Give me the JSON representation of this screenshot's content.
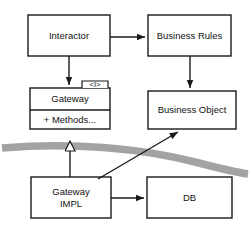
{
  "diagram": {
    "style": {
      "box_fill": "#ffffff",
      "box_stroke": "#1a1a1a",
      "connector_color": "#1a1a1a",
      "boundary_band_color": "#a0a0a0",
      "background": "#ffffff"
    },
    "nodes": [
      {
        "id": "interactor",
        "label": "Interactor",
        "x": 28,
        "y": 15,
        "w": 82,
        "h": 41,
        "type": "class-box"
      },
      {
        "id": "business-rules",
        "label": "Business Rules",
        "x": 148,
        "y": 15,
        "w": 83,
        "h": 41,
        "type": "class-box"
      },
      {
        "id": "gateway",
        "label": "Gateway",
        "compartment_label": "+ Methods...",
        "stereotype": "<I>",
        "x": 30,
        "y": 88,
        "w": 80,
        "h": 41,
        "divider_y": 110,
        "type": "interface-box"
      },
      {
        "id": "business-object",
        "label": "Business Object",
        "x": 148,
        "y": 91,
        "w": 88,
        "h": 38,
        "type": "class-box"
      },
      {
        "id": "gateway-impl",
        "label": "Gateway\nIMPL",
        "x": 31,
        "y": 177,
        "w": 80,
        "h": 41,
        "type": "class-box"
      },
      {
        "id": "db",
        "label": "DB",
        "x": 147,
        "y": 177,
        "w": 85,
        "h": 41,
        "type": "class-box"
      }
    ],
    "connectors": [
      {
        "id": "interactor-to-business-rules",
        "from": "interactor",
        "to": "business-rules",
        "arrow": "filled",
        "kind": "association"
      },
      {
        "id": "interactor-to-gateway",
        "from": "interactor",
        "to": "gateway",
        "arrow": "filled",
        "kind": "association"
      },
      {
        "id": "business-rules-to-business-object",
        "from": "business-rules",
        "to": "business-object",
        "arrow": "filled",
        "kind": "association"
      },
      {
        "id": "gateway-impl-to-gateway",
        "from": "gateway-impl",
        "to": "gateway",
        "arrow": "hollow-triangle",
        "kind": "realization"
      },
      {
        "id": "gateway-impl-to-business-object",
        "from": "gateway-impl",
        "to": "business-object",
        "arrow": "filled",
        "kind": "association"
      },
      {
        "id": "gateway-impl-to-db",
        "from": "gateway-impl",
        "to": "db",
        "arrow": "filled",
        "kind": "association"
      }
    ],
    "boundary_band": {
      "id": "architectural-boundary",
      "description": "gray curved boundary band crossing the diagram"
    }
  }
}
